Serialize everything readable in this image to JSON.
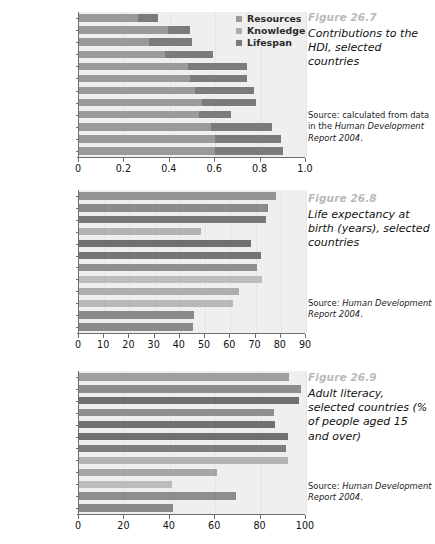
{
  "figures": [
    {
      "number": "Figure 26.7",
      "title": "Contributions to the HDI, selected countries",
      "source": "Source: calculated from data in the ",
      "source_italic": "Human Development Report 2004",
      "source_tail": ".",
      "legend": [
        {
          "label": "Resources",
          "color": "#9a9a9a"
        },
        {
          "label": "Knowledge",
          "color": "#adadad"
        },
        {
          "label": "Lifespan",
          "color": "#7b7b7b"
        }
      ],
      "xticks": [
        "0",
        "0.2",
        "0.4",
        "0.6",
        "0.8",
        "1.0"
      ]
    },
    {
      "number": "Figure 26.8",
      "title": "Life expectancy at birth (years), selected countries",
      "source": "Source: ",
      "source_italic": "Human Development Report 2004",
      "source_tail": ".",
      "xticks": [
        "0",
        "10",
        "20",
        "30",
        "40",
        "50",
        "60",
        "70",
        "80",
        "90"
      ]
    },
    {
      "number": "Figure 26.9",
      "title": "Adult literacy, selected countries (% of people aged 15 and over)",
      "source": "Source: ",
      "source_italic": "Human Development Report 2004",
      "source_tail": ".",
      "xticks": [
        "0",
        "20",
        "40",
        "60",
        "80",
        "100"
      ]
    }
  ],
  "chart_data": [
    {
      "type": "bar",
      "stacked": true,
      "orientation": "horizontal",
      "title": "Contributions to the HDI, selected countries",
      "xlabel": "",
      "ylabel": "",
      "xlim": [
        0,
        1.0
      ],
      "xticks": [
        0,
        0.2,
        0.4,
        0.6,
        0.8,
        1.0
      ],
      "grid": true,
      "legend_position": "top-right",
      "categories": [
        "Ethiopia",
        "Uganda",
        "Bangladesh",
        "India",
        "Sri Lanka",
        "China",
        "Colombia",
        "Brazil",
        "South Africa",
        "Argentina",
        "South Korea",
        "Singapore"
      ],
      "series": [
        {
          "name": "Resources",
          "color": "#9a9a9a",
          "values": [
            0.26,
            0.39,
            0.31,
            0.38,
            0.48,
            0.49,
            0.51,
            0.54,
            0.53,
            0.58,
            0.6,
            0.6
          ]
        },
        {
          "name": "Knowledge",
          "color": "#adadad",
          "values": [
            0.0,
            0.0,
            0.0,
            0.0,
            0.0,
            0.0,
            0.0,
            0.0,
            0.0,
            0.0,
            0.0,
            0.0
          ]
        },
        {
          "name": "Lifespan",
          "color": "#7b7b7b",
          "values": [
            0.09,
            0.1,
            0.19,
            0.21,
            0.26,
            0.25,
            0.26,
            0.24,
            0.14,
            0.27,
            0.29,
            0.3
          ]
        }
      ],
      "totals": [
        0.35,
        0.49,
        0.5,
        0.59,
        0.74,
        0.74,
        0.77,
        0.78,
        0.67,
        0.85,
        0.89,
        0.9
      ]
    },
    {
      "type": "bar",
      "orientation": "horizontal",
      "title": "Life expectancy at birth (years), selected countries",
      "xlabel": "",
      "ylabel": "",
      "xlim": [
        0,
        90
      ],
      "xticks": [
        0,
        10,
        20,
        30,
        40,
        50,
        60,
        70,
        80,
        90
      ],
      "grid": true,
      "categories": [
        "Singapore",
        "South Korea",
        "Argentina",
        "South Africa",
        "Brazil",
        "Colombia",
        "China",
        "Sri Lanka",
        "India",
        "Bangladesh",
        "Uganda",
        "Ethiopia"
      ],
      "values": [
        78,
        75,
        74,
        48.5,
        68,
        72,
        70.5,
        72.5,
        63.5,
        61,
        45.5,
        45
      ],
      "bar_colors": [
        "#949494",
        "#8c8c8c",
        "#787878",
        "#b3b3b3",
        "#6f6f6f",
        "#757575",
        "#8f8f8f",
        "#bdbdbd",
        "#adadad",
        "#b8b8b8",
        "#8a8a8a",
        "#8a8a8a"
      ]
    },
    {
      "type": "bar",
      "orientation": "horizontal",
      "title": "Adult literacy, selected countries (% of people aged 15 and over)",
      "xlabel": "",
      "ylabel": "",
      "xlim": [
        0,
        100
      ],
      "xticks": [
        0,
        20,
        40,
        60,
        80,
        100
      ],
      "grid": true,
      "categories": [
        "Singapore",
        "South Korea",
        "Argentina",
        "South Africa",
        "Brazil",
        "Colombia",
        "China",
        "Sri Lanka",
        "India",
        "Bangladesh",
        "Uganda",
        "Ethiopia"
      ],
      "values": [
        92.5,
        98,
        97,
        86,
        86.5,
        92,
        91,
        92,
        61,
        41,
        69,
        41.5
      ],
      "bar_colors": [
        "#9e9e9e",
        "#8d8d8d",
        "#6f6f6f",
        "#8f8f8f",
        "#717171",
        "#6f6f6f",
        "#7d7d7d",
        "#b2b2b2",
        "#a5a5a5",
        "#bcbcbc",
        "#8d8d8d",
        "#8a8a8a"
      ]
    }
  ]
}
